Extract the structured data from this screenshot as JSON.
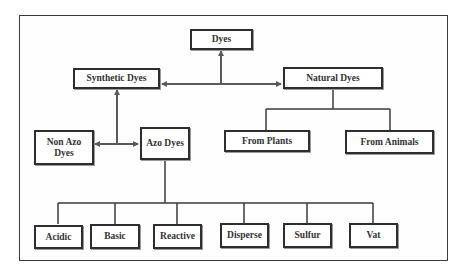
{
  "diagram": {
    "colors": {
      "line": "#3a3a3a",
      "arrow": "#5a5a5a",
      "text": "#333333",
      "box_border": "#2e2e2e"
    },
    "nodes": {
      "dyes": "Dyes",
      "synthetic": "Synthetic Dyes",
      "natural": "Natural Dyes",
      "non_azo": "Non Azo Dyes",
      "azo": "Azo Dyes",
      "from_plants": "From Plants",
      "from_animals": "From Animals",
      "acidic": "Acidic",
      "basic": "Basic",
      "reactive": "Reactive",
      "disperse": "Disperse",
      "sulfur": "Sulfur",
      "vat": "Vat"
    },
    "edges": [
      {
        "from": "Dyes",
        "to": "Synthetic Dyes",
        "style": "arrow"
      },
      {
        "from": "Dyes",
        "to": "Natural Dyes",
        "style": "arrow"
      },
      {
        "from": "Synthetic Dyes",
        "to": "Non Azo Dyes",
        "style": "arrow"
      },
      {
        "from": "Synthetic Dyes",
        "to": "Azo Dyes",
        "style": "arrow"
      },
      {
        "from": "Natural Dyes",
        "to": "From Plants",
        "style": "tree"
      },
      {
        "from": "Natural Dyes",
        "to": "From Animals",
        "style": "tree"
      },
      {
        "from": "Azo Dyes",
        "to": "Acidic",
        "style": "tree"
      },
      {
        "from": "Azo Dyes",
        "to": "Basic",
        "style": "tree"
      },
      {
        "from": "Azo Dyes",
        "to": "Reactive",
        "style": "tree"
      },
      {
        "from": "Azo Dyes",
        "to": "Disperse",
        "style": "tree"
      },
      {
        "from": "Azo Dyes",
        "to": "Sulfur",
        "style": "tree"
      },
      {
        "from": "Azo Dyes",
        "to": "Vat",
        "style": "tree"
      }
    ]
  }
}
